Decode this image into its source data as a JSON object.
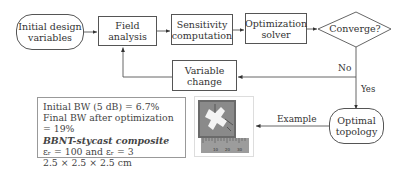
{
  "flowchart": {
    "nodes": {
      "initial": {
        "label_line1": "Initial design",
        "label_line2": "variables"
      },
      "field": {
        "label_line1": "Field",
        "label_line2": "analysis"
      },
      "sensitivity": {
        "label_line1": "Sensitivity",
        "label_line2": "computation"
      },
      "solver": {
        "label_line1": "Optimization",
        "label_line2": "solver"
      },
      "converge": {
        "label": "Converge?"
      },
      "variable_change": {
        "label_line1": "Variable",
        "label_line2": "change"
      },
      "optimal": {
        "label_line1": "Optimal",
        "label_line2": "topology"
      }
    },
    "edge_labels": {
      "no": "No",
      "yes": "Yes",
      "example": "Example"
    }
  },
  "example_box": {
    "line1": "Initial BW (5 dB) = 6.7%",
    "line2": "Final BW after optimization = 19%",
    "line3": "BBNT-stycast composite",
    "line4": "εᵣ = 100 and εᵣ = 3",
    "line5": "2.5 × 2.5 × 2.5 cm"
  },
  "photo": {
    "description": "Fabricated optimal topology sample with ruler",
    "ruler_ticks": [
      "10",
      "20",
      "30"
    ]
  },
  "colors": {
    "line": "#555555",
    "text": "#333333",
    "photo_dark": "#6a6a6a",
    "photo_white": "#f4f4f4"
  }
}
